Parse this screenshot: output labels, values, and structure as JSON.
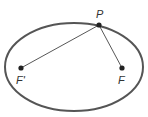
{
  "diagram": {
    "type": "ellipse-foci",
    "ellipse": {
      "cx": 74,
      "cy": 67,
      "rx": 69,
      "ry": 44,
      "stroke": "#555555",
      "stroke_width": 2
    },
    "points": {
      "P": {
        "label": "P",
        "x": 99,
        "y": 25
      },
      "F_prime": {
        "label": "F'",
        "x": 21,
        "y": 68
      },
      "F": {
        "label": "F",
        "x": 122,
        "y": 68
      }
    },
    "segments": [
      {
        "from": "P",
        "to": "F_prime"
      },
      {
        "from": "P",
        "to": "F"
      }
    ],
    "line_color": "#444444",
    "point_color": "#222222"
  }
}
